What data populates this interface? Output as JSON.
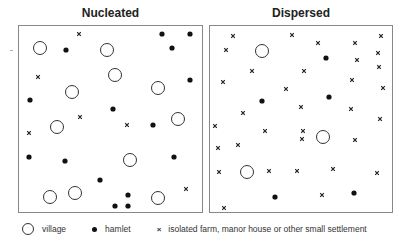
{
  "panels": {
    "nucleated": {
      "title": "Nucleated",
      "box": {
        "x": 18,
        "y": 25,
        "w": 185,
        "h": 188
      },
      "villages": [
        [
          40,
          48
        ],
        [
          107,
          50
        ],
        [
          115,
          75
        ],
        [
          72,
          92
        ],
        [
          158,
          88
        ],
        [
          57,
          127
        ],
        [
          178,
          119
        ],
        [
          130,
          160
        ],
        [
          50,
          197
        ],
        [
          75,
          193
        ],
        [
          158,
          198
        ]
      ],
      "hamlets": [
        [
          66,
          50
        ],
        [
          162,
          34
        ],
        [
          190,
          34
        ],
        [
          172,
          48
        ],
        [
          190,
          80
        ],
        [
          30,
          100
        ],
        [
          113,
          109
        ],
        [
          153,
          125
        ],
        [
          29,
          157
        ],
        [
          65,
          161
        ],
        [
          174,
          157
        ],
        [
          100,
          180
        ],
        [
          128,
          195
        ],
        [
          115,
          206
        ],
        [
          128,
          206
        ]
      ],
      "farms": [
        [
          79,
          34
        ],
        [
          38,
          77
        ],
        [
          80,
          117
        ],
        [
          127,
          125
        ],
        [
          29,
          133
        ],
        [
          186,
          189
        ]
      ]
    },
    "dispersed": {
      "title": "Dispersed",
      "box": {
        "x": 209,
        "y": 25,
        "w": 184,
        "h": 188
      },
      "villages": [
        [
          262,
          51
        ],
        [
          323,
          137
        ],
        [
          247,
          172
        ]
      ],
      "hamlets": [
        [
          326,
          58
        ],
        [
          262,
          101
        ],
        [
          329,
          97
        ],
        [
          275,
          197
        ],
        [
          354,
          193
        ]
      ],
      "farms": [
        [
          233,
          36
        ],
        [
          292,
          35
        ],
        [
          318,
          43
        ],
        [
          355,
          43
        ],
        [
          381,
          36
        ],
        [
          226,
          50
        ],
        [
          357,
          60
        ],
        [
          378,
          53
        ],
        [
          252,
          71
        ],
        [
          304,
          71
        ],
        [
          379,
          67
        ],
        [
          223,
          82
        ],
        [
          286,
          89
        ],
        [
          352,
          80
        ],
        [
          383,
          88
        ],
        [
          301,
          107
        ],
        [
          351,
          109
        ],
        [
          243,
          113
        ],
        [
          215,
          126
        ],
        [
          380,
          119
        ],
        [
          265,
          131
        ],
        [
          303,
          131
        ],
        [
          218,
          148
        ],
        [
          238,
          145
        ],
        [
          302,
          139
        ],
        [
          355,
          140
        ],
        [
          219,
          172
        ],
        [
          269,
          171
        ],
        [
          297,
          171
        ],
        [
          333,
          169
        ],
        [
          377,
          173
        ],
        [
          322,
          195
        ],
        [
          224,
          208
        ]
      ]
    }
  },
  "legend": {
    "village": "village",
    "hamlet": "hamlet",
    "farm_symbol": "×",
    "farm": "isolated farm, manor house or other small settlement"
  },
  "colors": {
    "ink": "#111111",
    "border": "#888888"
  }
}
